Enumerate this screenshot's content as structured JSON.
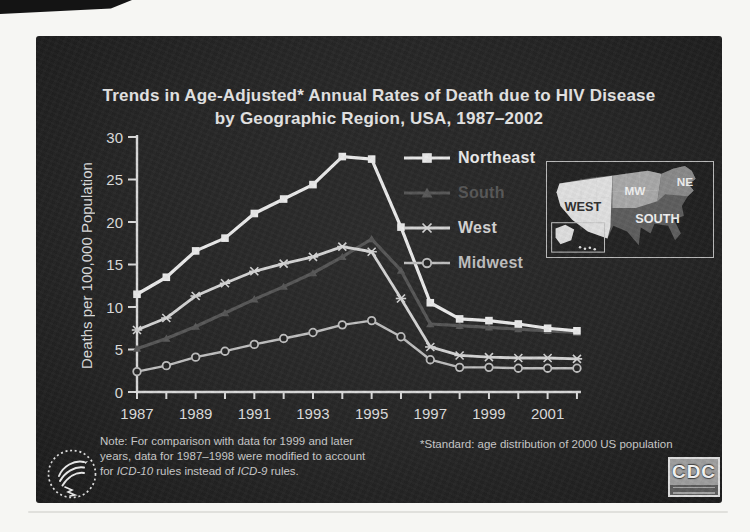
{
  "page": {
    "background": "#f6f6f3",
    "slide_background": "#272727"
  },
  "slide": {
    "title_line1": "Trends in Age-Adjusted* Annual Rates of Death due to HIV Disease",
    "title_line2": "by Geographic Region, USA, 1987–2002",
    "footnote": "*Standard: age distribution of 2000 US population",
    "note": {
      "line1": "Note: For comparison with data for 1999 and later",
      "line2": "years, data for 1987–1998 were modified to account",
      "line3_pre": "for ",
      "line3_icd10": "ICD-10",
      "line3_mid": " rules instead of ",
      "line3_icd9": "ICD-9",
      "line3_post": " rules."
    },
    "cdc_logo_text": "CDC"
  },
  "chart_data": {
    "type": "line",
    "title": "Trends in Age-Adjusted* Annual Rates of Death due to HIV Disease by Geographic Region, USA, 1987–2002",
    "ylabel": "Deaths per 100,000 Population",
    "xlabel": "",
    "ylim": [
      0,
      30
    ],
    "yticks": [
      0,
      5,
      10,
      15,
      20,
      25,
      30
    ],
    "x": [
      1987,
      1988,
      1989,
      1990,
      1991,
      1992,
      1993,
      1994,
      1995,
      1996,
      1997,
      1998,
      1999,
      2000,
      2001,
      2002
    ],
    "x_tick_labels": [
      "1987",
      "1989",
      "1991",
      "1993",
      "1995",
      "1997",
      "1999",
      "2001"
    ],
    "grid": false,
    "legend_position": "upper right inside",
    "axis_color": "#d9d9d9",
    "series": [
      {
        "name": "Northeast",
        "marker": "square",
        "color": "#eaeaea",
        "values": [
          11.5,
          13.5,
          16.6,
          18.1,
          21.0,
          22.7,
          24.4,
          27.7,
          27.4,
          19.4,
          10.5,
          8.6,
          8.4,
          8.0,
          7.5,
          7.2
        ]
      },
      {
        "name": "South",
        "marker": "triangle",
        "color": "#575757",
        "values": [
          5.1,
          6.3,
          7.7,
          9.3,
          10.9,
          12.4,
          14.0,
          15.9,
          18.0,
          14.3,
          8.0,
          7.8,
          7.6,
          7.4,
          7.2,
          7.0
        ]
      },
      {
        "name": "West",
        "marker": "asterisk",
        "color": "#d4d4d4",
        "values": [
          7.3,
          8.7,
          11.3,
          12.8,
          14.2,
          15.1,
          15.9,
          17.1,
          16.5,
          11.0,
          5.3,
          4.3,
          4.1,
          4.0,
          4.0,
          3.9
        ]
      },
      {
        "name": "Midwest",
        "marker": "circle-open",
        "color": "#bfbfbf",
        "values": [
          2.4,
          3.1,
          4.1,
          4.8,
          5.6,
          6.3,
          7.0,
          7.9,
          8.4,
          6.5,
          3.8,
          2.9,
          2.9,
          2.8,
          2.8,
          2.8
        ]
      }
    ]
  },
  "map": {
    "name": "us-census-regions-inset",
    "regions": [
      {
        "label": "WEST",
        "fill": "#e0e0e0",
        "label_color": "#2f2f2f"
      },
      {
        "label": "MW",
        "fill": "#a8a8a8",
        "label_color": "#f0f0f0"
      },
      {
        "label": "NE",
        "fill": "#8a8a8a",
        "label_color": "#f0f0f0"
      },
      {
        "label": "SOUTH",
        "fill": "#5e5e5e",
        "label_color": "#f0f0f0"
      }
    ]
  }
}
